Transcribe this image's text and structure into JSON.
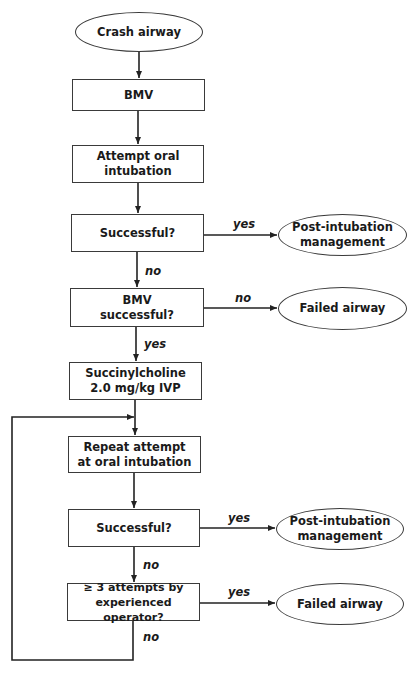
{
  "diagram": {
    "type": "flowchart",
    "colors": {
      "line": "#222222",
      "border": "#3a3a3a",
      "text": "#1a1a1a",
      "background": "#ffffff"
    },
    "nodes": {
      "crash": {
        "shape": "ellipse",
        "text": "Crash airway"
      },
      "bmv": {
        "shape": "rect",
        "text": "BMV"
      },
      "attempt": {
        "shape": "rect",
        "text": "Attempt oral\nintubation"
      },
      "success1": {
        "shape": "rect",
        "text": "Successful?"
      },
      "post1": {
        "shape": "ellipse",
        "text": "Post-intubation\nmanagement"
      },
      "bmv_success": {
        "shape": "rect",
        "text": "BMV\nsuccessful?"
      },
      "failed1": {
        "shape": "ellipse",
        "text": "Failed airway"
      },
      "sux": {
        "shape": "rect",
        "text": "Succinylcholine\n2.0 mg/kg IVP"
      },
      "repeat": {
        "shape": "rect",
        "text": "Repeat attempt\nat oral intubation"
      },
      "success2": {
        "shape": "rect",
        "text": "Successful?"
      },
      "post2": {
        "shape": "ellipse",
        "text": "Post-intubation\nmanagement"
      },
      "attempts3": {
        "shape": "rect",
        "text": "≥ 3 attempts by\nexperienced operator?"
      },
      "failed2": {
        "shape": "ellipse",
        "text": "Failed airway"
      }
    },
    "edge_labels": {
      "success1_yes": "yes",
      "success1_no": "no",
      "bmv_success_no": "no",
      "bmv_success_yes": "yes",
      "success2_yes": "yes",
      "success2_no": "no",
      "attempts3_yes": "yes",
      "attempts3_no": "no"
    },
    "edges": [
      {
        "from": "crash",
        "to": "bmv"
      },
      {
        "from": "bmv",
        "to": "attempt"
      },
      {
        "from": "attempt",
        "to": "success1"
      },
      {
        "from": "success1",
        "to": "post1",
        "label": "yes"
      },
      {
        "from": "success1",
        "to": "bmv_success",
        "label": "no"
      },
      {
        "from": "bmv_success",
        "to": "failed1",
        "label": "no"
      },
      {
        "from": "bmv_success",
        "to": "sux",
        "label": "yes"
      },
      {
        "from": "sux",
        "to": "repeat"
      },
      {
        "from": "repeat",
        "to": "success2"
      },
      {
        "from": "success2",
        "to": "post2",
        "label": "yes"
      },
      {
        "from": "success2",
        "to": "attempts3",
        "label": "no"
      },
      {
        "from": "attempts3",
        "to": "failed2",
        "label": "yes"
      },
      {
        "from": "attempts3",
        "to": "repeat",
        "label": "no"
      }
    ]
  }
}
